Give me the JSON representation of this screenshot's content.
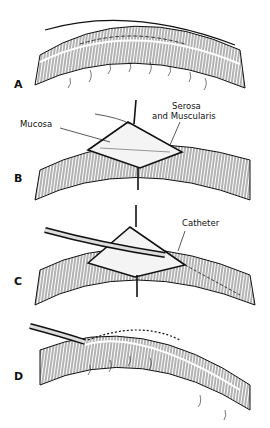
{
  "figure": {
    "panels": [
      {
        "letter": "A",
        "labels": []
      },
      {
        "letter": "B",
        "labels": [
          "Mucosa",
          "Serosa",
          "and Muscularis"
        ]
      },
      {
        "letter": "C",
        "labels": [
          "Catheter"
        ]
      },
      {
        "letter": "D",
        "labels": []
      }
    ]
  },
  "colors": {
    "ink": "#111111",
    "background": "#ffffff"
  }
}
